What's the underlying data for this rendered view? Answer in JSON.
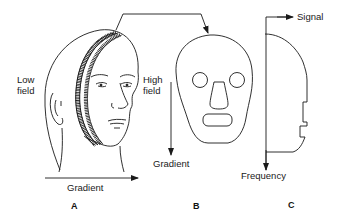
{
  "figure": {
    "panels": [
      {
        "id": "A",
        "label": "A",
        "description": "head with slice"
      },
      {
        "id": "B",
        "label": "B",
        "description": "axial slice cross-section"
      },
      {
        "id": "C",
        "label": "C",
        "description": "projection profile"
      }
    ],
    "labels": {
      "low_field_line1": "Low",
      "low_field_line2": "field",
      "high_field_line1": "High",
      "high_field_line2": "field",
      "gradient_a": "Gradient",
      "gradient_b": "Gradient",
      "signal": "Signal",
      "frequency": "Frequency"
    },
    "colors": {
      "stroke": "#1a1a1a",
      "background": "#ffffff"
    }
  }
}
